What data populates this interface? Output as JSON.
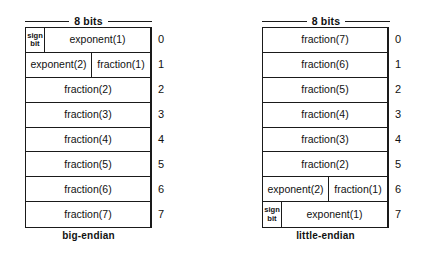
{
  "figure": {
    "type": "byte-layout-diagram"
  },
  "diagrams": [
    {
      "id": "big-endian",
      "bits_label": "8 bits",
      "caption": "big-endian",
      "rows": [
        {
          "index": "0",
          "fields": [
            {
              "kind": "sign",
              "line1": "sign",
              "line2": "bit"
            },
            {
              "kind": "exp1",
              "label": "exponent(1)"
            }
          ]
        },
        {
          "index": "1",
          "fields": [
            {
              "kind": "exp2",
              "label": "exponent(2)"
            },
            {
              "kind": "frac1",
              "label": "fraction(1)"
            }
          ]
        },
        {
          "index": "2",
          "fields": [
            {
              "kind": "full",
              "label": "fraction(2)"
            }
          ]
        },
        {
          "index": "3",
          "fields": [
            {
              "kind": "full",
              "label": "fraction(3)"
            }
          ]
        },
        {
          "index": "4",
          "fields": [
            {
              "kind": "full",
              "label": "fraction(4)"
            }
          ]
        },
        {
          "index": "5",
          "fields": [
            {
              "kind": "full",
              "label": "fraction(5)"
            }
          ]
        },
        {
          "index": "6",
          "fields": [
            {
              "kind": "full",
              "label": "fraction(6)"
            }
          ]
        },
        {
          "index": "7",
          "fields": [
            {
              "kind": "full",
              "label": "fraction(7)"
            }
          ]
        }
      ]
    },
    {
      "id": "little-endian",
      "bits_label": "8 bits",
      "caption": "little-endian",
      "rows": [
        {
          "index": "0",
          "fields": [
            {
              "kind": "full",
              "label": "fraction(7)"
            }
          ]
        },
        {
          "index": "1",
          "fields": [
            {
              "kind": "full",
              "label": "fraction(6)"
            }
          ]
        },
        {
          "index": "2",
          "fields": [
            {
              "kind": "full",
              "label": "fraction(5)"
            }
          ]
        },
        {
          "index": "3",
          "fields": [
            {
              "kind": "full",
              "label": "fraction(4)"
            }
          ]
        },
        {
          "index": "4",
          "fields": [
            {
              "kind": "full",
              "label": "fraction(3)"
            }
          ]
        },
        {
          "index": "5",
          "fields": [
            {
              "kind": "full",
              "label": "fraction(2)"
            }
          ]
        },
        {
          "index": "6",
          "fields": [
            {
              "kind": "exp2",
              "label": "exponent(2)"
            },
            {
              "kind": "frac1",
              "label": "fraction(1)"
            }
          ]
        },
        {
          "index": "7",
          "fields": [
            {
              "kind": "sign",
              "line1": "sign",
              "line2": "bit"
            },
            {
              "kind": "exp1",
              "label": "exponent(1)"
            }
          ]
        }
      ]
    }
  ],
  "colors": {
    "background": "#ffffff",
    "stroke": "#1a1a1a",
    "text": "#111111"
  }
}
